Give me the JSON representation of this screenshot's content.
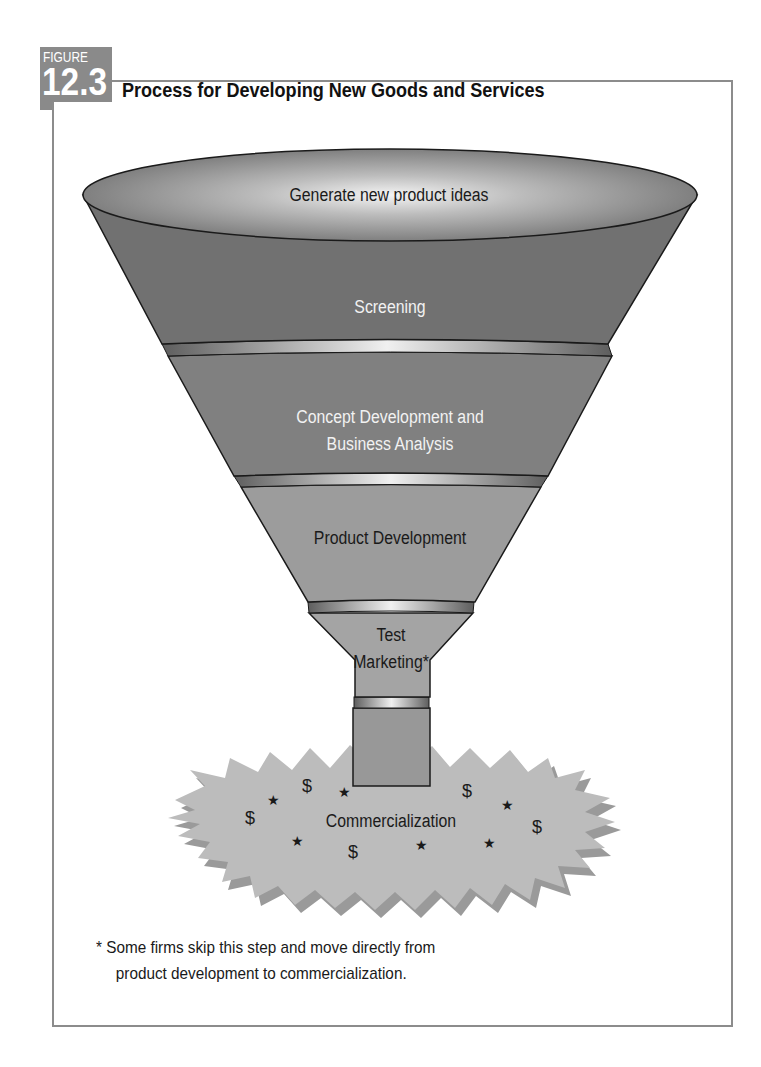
{
  "figure": {
    "label_word": "FIGURE",
    "label_number": "12.3",
    "title": "Process for Developing New Goods and Services"
  },
  "funnel": {
    "stages": [
      {
        "id": "ideas",
        "label": "Generate new product ideas"
      },
      {
        "id": "screening",
        "label": "Screening"
      },
      {
        "id": "concept",
        "label_line1": "Concept Development and",
        "label_line2": "Business Analysis"
      },
      {
        "id": "product",
        "label": "Product Development"
      },
      {
        "id": "test",
        "label_line1": "Test",
        "label_line2": "Marketing*"
      },
      {
        "id": "commercialization",
        "label": "Commercialization"
      }
    ],
    "decorations": {
      "dollar": "$",
      "star": "★"
    }
  },
  "footnote": {
    "line1": "* Some firms skip this step and move directly from",
    "line2": "product development to commercialization."
  },
  "colors": {
    "frame": "#8c8c8c",
    "badge": "#8a8a8a",
    "funnel_dark": "#6b6b6b",
    "funnel_mid": "#7a7a7a",
    "funnel_light": "#9a9a9a",
    "starburst": "#b8b8b8",
    "outline": "#1a1a1a"
  }
}
